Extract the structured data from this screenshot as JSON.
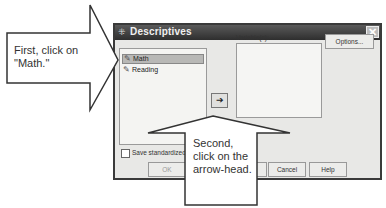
{
  "dialog": {
    "title": "Descriptives",
    "title_icon": "descriptives-icon",
    "close_label": "✕",
    "source_list": {
      "items": [
        {
          "label": "Math",
          "icon": "scale-variable-icon",
          "selected": true
        },
        {
          "label": "Reading",
          "icon": "scale-variable-icon",
          "selected": false
        }
      ]
    },
    "move_button_glyph": "➔",
    "variables_label": "Variable(s):",
    "options_label": "Options...",
    "save_standardized_label": "Save standardized",
    "buttons": {
      "ok": "OK",
      "paste": "",
      "cancel": "Cancel",
      "help": "Help"
    }
  },
  "annotations": {
    "first": "First, click on \"Math.\"",
    "second": "Second, click on the arrow-head."
  },
  "colors": {
    "titlebar": "#3a3a3a",
    "dialog_bg": "#e8e8e6",
    "selection": "#b8b8b6",
    "callout_stroke": "#333333"
  }
}
